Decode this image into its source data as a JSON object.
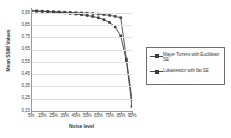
{
  "chart_data": {
    "type": "line",
    "title": "",
    "xlabel": "Noise level",
    "ylabel": "Mean SSIM Values",
    "categories": [
      "5%",
      "10%",
      "15%",
      "20%",
      "25%",
      "30%",
      "35%",
      "40%",
      "45%",
      "50%",
      "55%",
      "60%",
      "65%",
      "70%",
      "75%",
      "80%",
      "85%",
      "90%",
      "95%"
    ],
    "xtick_labels": [
      "5%",
      "15%",
      "25%",
      "35%",
      "45%",
      "55%",
      "65%",
      "75%",
      "85%",
      "95%"
    ],
    "ytick_labels": [
      "0,95",
      "0,85",
      "0,75",
      "0,65",
      "0,55",
      "0,45",
      "0,35",
      "0,25",
      "0,15"
    ],
    "ylim": [
      0.15,
      0.99
    ],
    "yticks": [
      0.95,
      0.85,
      0.75,
      0.65,
      0.55,
      0.45,
      0.35,
      0.25,
      0.15
    ],
    "grid": true,
    "legend_position": "right",
    "series": [
      {
        "name": "Mayer Torrens with Euclidean SE",
        "color": "#4a4a4a",
        "marker": "square",
        "values": [
          0.968,
          0.966,
          0.964,
          0.962,
          0.96,
          0.958,
          0.956,
          0.954,
          0.952,
          0.95,
          0.948,
          0.945,
          0.941,
          0.936,
          0.93,
          0.922,
          0.911,
          0.575,
          0.248
        ]
      },
      {
        "name": "Lukasiewicz with flat SE",
        "color": "#3c3c3c",
        "marker": "square",
        "values": [
          0.967,
          0.964,
          0.962,
          0.959,
          0.956,
          0.953,
          0.95,
          0.946,
          0.941,
          0.936,
          0.929,
          0.921,
          0.91,
          0.895,
          0.872,
          0.836,
          0.762,
          0.56,
          0.188
        ]
      }
    ]
  },
  "legend": {
    "entries": [
      {
        "label": "Mayer Torrens with Euclidean SE"
      },
      {
        "label": "Lukasiewicz with flat SE"
      }
    ]
  }
}
